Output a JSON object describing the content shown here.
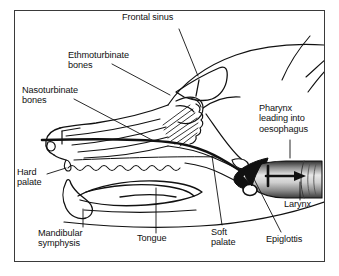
{
  "figure": {
    "type": "anatomical-line-diagram",
    "frame": {
      "border_color": "#3a3a3a",
      "background": "#ffffff"
    },
    "ink_color": "#111111",
    "labels": [
      {
        "id": "frontal-sinus",
        "text": "Frontal sinus",
        "x": 122,
        "y": 17,
        "align": "left"
      },
      {
        "id": "ethmoturbinate-bones",
        "text": "Ethmoturbinate\nbones",
        "x": 68,
        "y": 55,
        "align": "left"
      },
      {
        "id": "nasoturbinate-bones",
        "text": "Nasoturbinate\nbones",
        "x": 30,
        "y": 90,
        "align": "left"
      },
      {
        "id": "pharynx-oesophagus",
        "text": "Pharynx\nleading into\noesophagus",
        "x": 258,
        "y": 108,
        "align": "left"
      },
      {
        "id": "hard-palate",
        "text": "Hard\npalate",
        "x": 17,
        "y": 172,
        "align": "left"
      },
      {
        "id": "larynx",
        "text": "Larynx",
        "x": 284,
        "y": 203,
        "align": "left"
      },
      {
        "id": "mandibular-symphysis",
        "text": "Mandibular\nsymphysis",
        "x": 38,
        "y": 230,
        "align": "left"
      },
      {
        "id": "tongue",
        "text": "Tongue",
        "x": 137,
        "y": 235,
        "align": "left"
      },
      {
        "id": "soft-palate",
        "text": "Soft\npalate",
        "x": 211,
        "y": 229,
        "align": "left"
      },
      {
        "id": "epiglottis",
        "text": "Epiglottis",
        "x": 268,
        "y": 235,
        "align": "left"
      }
    ],
    "leader_lines": [
      {
        "from": "frontal-sinus",
        "path": "M 179 29 L 198 76"
      },
      {
        "from": "ethmoturbinate-bones",
        "path": "M 112 64 L 170 95"
      },
      {
        "from": "nasoturbinate-bones",
        "path": "M 74 99 L 152 140"
      },
      {
        "from": "pharynx-oesophagus",
        "path": "M 290 140 L 290 156"
      },
      {
        "from": "hard-palate",
        "path": "M 47 174 L 66 168"
      },
      {
        "from": "larynx",
        "path": "M 300 199 L 300 182"
      },
      {
        "from": "mandibular-symphysis",
        "path": "M 83 227 L 83 210"
      },
      {
        "from": "tongue",
        "path": "M 156 233 L 156 188"
      },
      {
        "from": "soft-palate",
        "path": "M 222 225 L 213 155"
      },
      {
        "from": "epiglottis",
        "path": "M 281 232 L 254 178"
      }
    ],
    "airflow_arrows": [
      {
        "id": "trachea-arrow-horizontal",
        "note": "arrow pointing caudally into the trachea"
      },
      {
        "id": "trachea-arrow-vertical",
        "note": "cross stroke on the tracheal arrow"
      }
    ]
  }
}
